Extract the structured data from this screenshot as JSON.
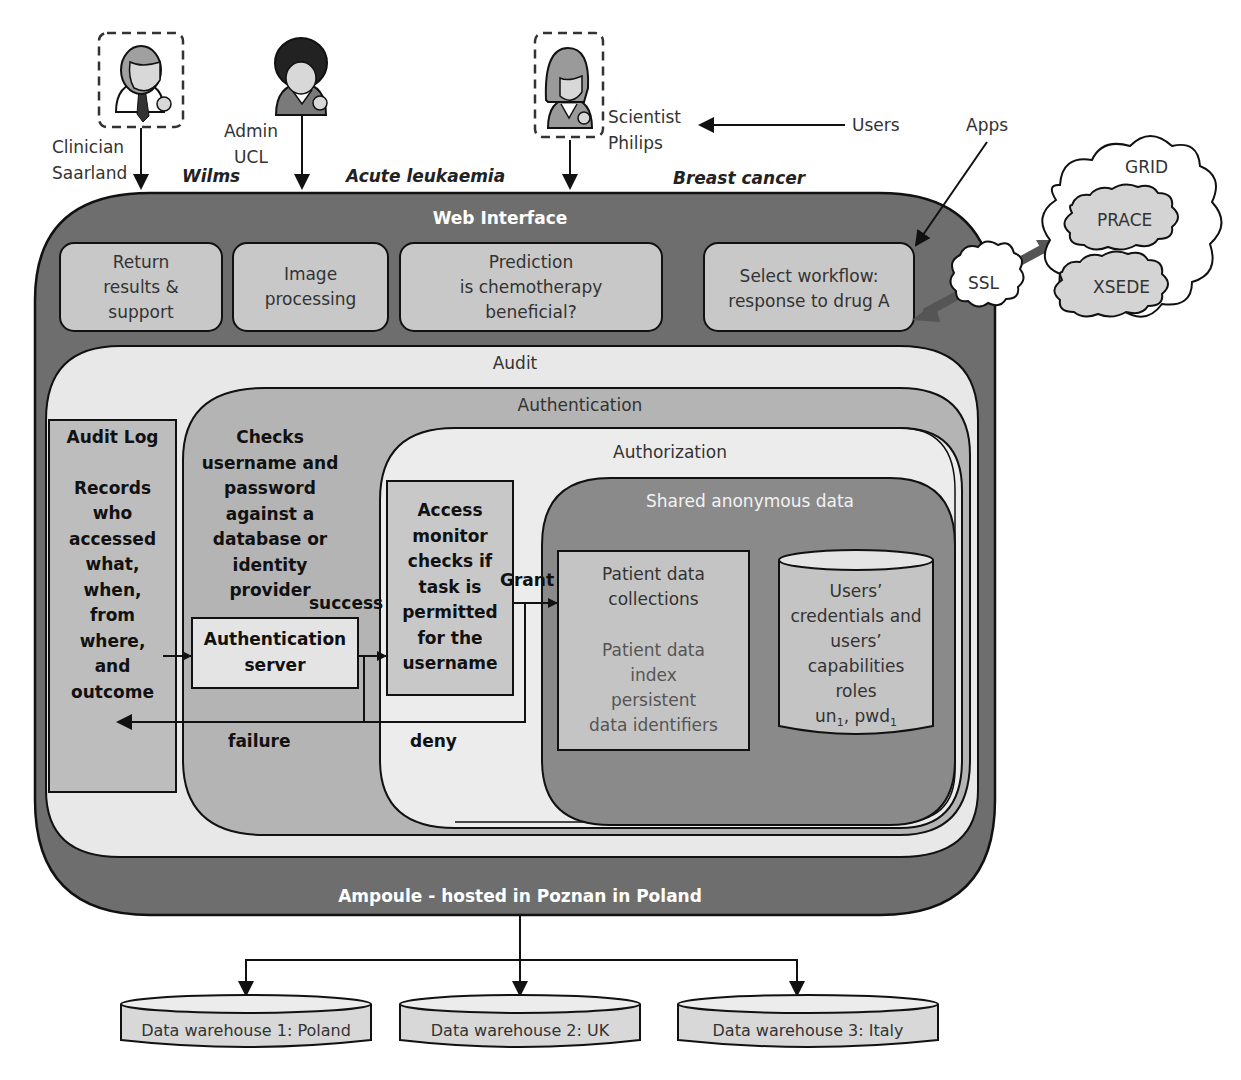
{
  "users": {
    "legend_label": "Users",
    "clinician": {
      "line1": "Clinician",
      "line2": "Saarland",
      "study": "Wilms"
    },
    "admin": {
      "line1": "Admin",
      "line2": "UCL",
      "study": "Acute leukaemia"
    },
    "scientist": {
      "line1": "Scientist",
      "line2": "Philips",
      "study": "Breast cancer"
    }
  },
  "apps_label": "Apps",
  "external": {
    "ssl": "SSL",
    "grid": "GRID",
    "prace": "PRACE",
    "xsede": "XSEDE"
  },
  "web_interface": {
    "title": "Web Interface",
    "modules": [
      {
        "lines": [
          "Return",
          "results &",
          "support"
        ]
      },
      {
        "lines": [
          "Image",
          "processing"
        ]
      },
      {
        "lines": [
          "Prediction",
          "is chemotherapy",
          "beneficial?"
        ]
      },
      {
        "lines": [
          "Select workflow:",
          "response to drug A"
        ]
      }
    ]
  },
  "audit": {
    "title": "Audit",
    "log_title": "Audit Log",
    "log_lines": [
      "Records",
      "who",
      "accessed",
      "what,",
      "when,",
      "from",
      "where,",
      "and",
      "outcome"
    ]
  },
  "authentication": {
    "title": "Authentication",
    "desc_lines": [
      "Checks",
      "username and",
      "password",
      "against a",
      "database or",
      "identity",
      "provider"
    ],
    "server_lines": [
      "Authentication",
      "server"
    ],
    "success": "success",
    "failure": "failure"
  },
  "authorization": {
    "title": "Authorization",
    "monitor_lines": [
      "Access",
      "monitor",
      "checks if",
      "task is",
      "permitted",
      "for the",
      "username"
    ],
    "grant": "Grant",
    "deny": "deny"
  },
  "shared_data": {
    "title": "Shared anonymous data",
    "collections_lines": [
      "Patient data",
      "collections"
    ],
    "index_lines": [
      "Patient data",
      "index",
      "persistent",
      "data identifiers"
    ],
    "credentials_lines": [
      "Users’",
      "credentials and",
      "users’",
      "capabilities",
      "roles"
    ],
    "credentials_vars": {
      "un": "un",
      "pwd": "pwd",
      "sub": "1",
      "sep": ", "
    }
  },
  "host_label": "Ampoule - hosted in Poznan in Poland",
  "warehouses": [
    {
      "label": "Data warehouse 1: Poland"
    },
    {
      "label": "Data warehouse 2: UK"
    },
    {
      "label": "Data warehouse 3: Italy"
    }
  ],
  "colors": {
    "outer_dark": "#6e6e6e",
    "module_fill": "#c8c8c8",
    "audit_fill": "#e8e8e8",
    "auth_fill": "#b4b4b4",
    "authz_fill": "#ececec",
    "shared_fill": "#8a8a8a",
    "inner_box_fill": "#c4c4c4",
    "ssl_arrow": "#555555"
  }
}
